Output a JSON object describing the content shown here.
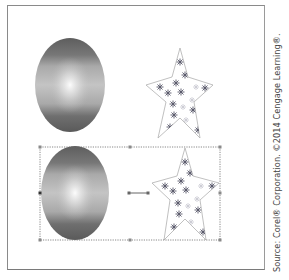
{
  "canvas": {
    "top_row": {
      "ellipse": {
        "name": "gradient-ellipse-original",
        "cx": 70,
        "cy": 85,
        "rx": 35,
        "ry": 47
      },
      "star": {
        "name": "snowflake-star-original",
        "points": "180,48 188,77 213,85 194,102 200,138 180,118 158,138 166,102 146,85 172,77"
      }
    },
    "bottom_row": {
      "ellipse": {
        "name": "gradient-ellipse-selected",
        "cx": 75,
        "cy": 193,
        "rx": 34,
        "ry": 47
      },
      "star": {
        "name": "snowflake-star-selected",
        "points": "185,148 193,176 219,183 200,200 206,240 185,219 164,240 170,200 152,183 177,176"
      }
    },
    "selection": {
      "x": 40,
      "y": 147,
      "w": 180,
      "h": 93
    },
    "rotation_center": {
      "x1": 129,
      "x2": 148,
      "y": 193
    }
  },
  "colors": {
    "frame_border": "#8a8a8a",
    "gradient_dark": "#5a5a5a",
    "gradient_mid": "#9c9c9c",
    "gradient_light": "#f2f2f2",
    "star_outline": "#b0b0b0",
    "snowflake": "#5c5c6a",
    "selection": "#6a6a6a"
  },
  "credit": {
    "text": "Source: Corel® Corporation. ©2014 Cengage Learning®."
  }
}
